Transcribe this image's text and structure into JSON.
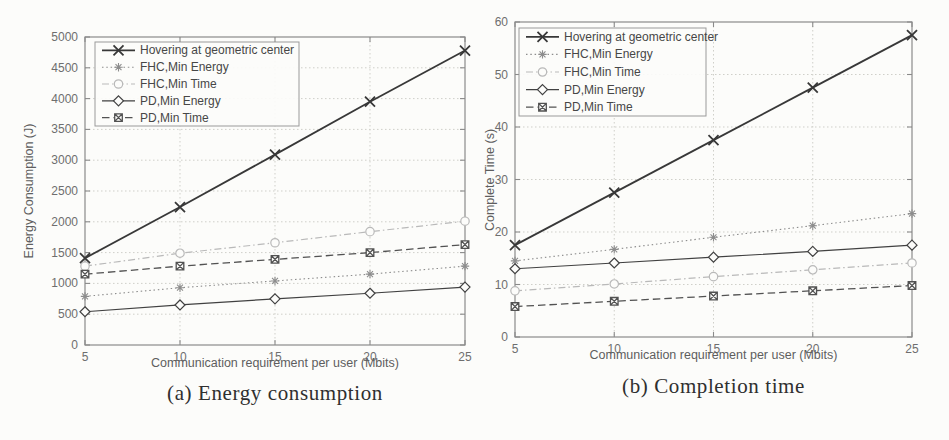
{
  "figure": {
    "background": "#fcfcfa",
    "axis_color": "#8a8a8a",
    "grid_color": "#cfcfc9",
    "tick_label_color": "#6e6e6e",
    "legend_text_color": "#474747"
  },
  "chart_data": [
    {
      "type": "line",
      "caption": "(a) Energy consumption",
      "xlabel": "Communication requirement per user (Mbits)",
      "ylabel": "Energy Consumption (J)",
      "xlim": [
        5,
        25
      ],
      "ylim": [
        0,
        5000
      ],
      "xticks": [
        5,
        10,
        15,
        20,
        25
      ],
      "yticks": [
        0,
        500,
        1000,
        1500,
        2000,
        2500,
        3000,
        3500,
        4000,
        4500,
        5000
      ],
      "grid": true,
      "legend_position": "top-left",
      "x": [
        5,
        10,
        15,
        20,
        25
      ],
      "series": [
        {
          "name": "Hovering at geometric center",
          "values": [
            1410,
            2240,
            3090,
            3950,
            4780
          ],
          "line": "solid",
          "marker": "x",
          "color": "#383838",
          "width": 1.8
        },
        {
          "name": "FHC,Min Energy",
          "values": [
            790,
            930,
            1040,
            1150,
            1280
          ],
          "line": "dotted",
          "marker": "asterisk",
          "color": "#8d8d8d",
          "width": 1.1
        },
        {
          "name": "FHC,Min Time",
          "values": [
            1280,
            1490,
            1660,
            1840,
            2010
          ],
          "line": "dashdot",
          "marker": "circle",
          "color": "#b9b9b9",
          "width": 1.2
        },
        {
          "name": "PD,Min Energy",
          "values": [
            540,
            650,
            750,
            840,
            940
          ],
          "line": "solid",
          "marker": "diamond",
          "color": "#414141",
          "width": 1.2
        },
        {
          "name": "PD,Min Time",
          "values": [
            1150,
            1280,
            1390,
            1500,
            1630
          ],
          "line": "dashed",
          "marker": "square-x",
          "color": "#525252",
          "width": 1.3
        }
      ]
    },
    {
      "type": "line",
      "caption": "(b) Completion time",
      "xlabel": "Communication requirement per user (Mbits)",
      "ylabel": "Complete Time (s)",
      "xlim": [
        5,
        25
      ],
      "ylim": [
        0,
        60
      ],
      "xticks": [
        5,
        10,
        15,
        20,
        25
      ],
      "yticks": [
        0,
        10,
        20,
        30,
        40,
        50,
        60
      ],
      "grid": true,
      "legend_position": "top-left",
      "x": [
        5,
        10,
        15,
        20,
        25
      ],
      "series": [
        {
          "name": "Hovering at geometric center",
          "values": [
            17.5,
            27.5,
            37.5,
            47.5,
            57.5
          ],
          "line": "solid",
          "marker": "x",
          "color": "#383838",
          "width": 1.8
        },
        {
          "name": "FHC,Min Energy",
          "values": [
            14.5,
            16.7,
            19,
            21.2,
            23.5
          ],
          "line": "dotted",
          "marker": "asterisk",
          "color": "#8d8d8d",
          "width": 1.1
        },
        {
          "name": "FHC,Min Time",
          "values": [
            8.8,
            10.1,
            11.5,
            12.8,
            14.1
          ],
          "line": "dashdot",
          "marker": "circle",
          "color": "#b9b9b9",
          "width": 1.2
        },
        {
          "name": "PD,Min Energy",
          "values": [
            13,
            14.1,
            15.2,
            16.3,
            17.5
          ],
          "line": "solid",
          "marker": "diamond",
          "color": "#414141",
          "width": 1.2
        },
        {
          "name": "PD,Min Time",
          "values": [
            5.8,
            6.8,
            7.8,
            8.8,
            9.8
          ],
          "line": "dashed",
          "marker": "square-x",
          "color": "#525252",
          "width": 1.3
        }
      ]
    }
  ]
}
